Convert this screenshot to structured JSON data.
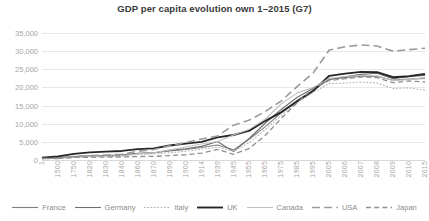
{
  "chart_data": {
    "type": "line",
    "title": "GDP per capita evolution own 1–2015 (G7)",
    "xlabel": "",
    "ylabel": "",
    "ylim": [
      0,
      35000
    ],
    "ytick_step": 5000,
    "ytick_labels": [
      "0",
      "5,000",
      "10,000",
      "15,000",
      "20,000",
      "25,000",
      "30,000",
      "35,000"
    ],
    "ytick_values": [
      0,
      5000,
      10000,
      15000,
      20000,
      25000,
      30000,
      35000
    ],
    "grid": "horizontal",
    "legend_position": "bottom",
    "xtick_rotation": 90,
    "categories": [
      "1",
      "1500",
      "1750",
      "1820",
      "1830",
      "1840",
      "1860",
      "1870",
      "1890",
      "1900",
      "1914",
      "1939",
      "1945",
      "1955",
      "1965",
      "1975",
      "1985",
      "1995",
      "2005",
      "2006",
      "2007",
      "2008",
      "2009",
      "2010",
      "2015"
    ],
    "series": [
      {
        "name": "France",
        "color": "#7f7f7f",
        "style": "solid",
        "width": 1.1,
        "values": [
          500,
          700,
          950,
          1150,
          1250,
          1400,
          1850,
          2000,
          2500,
          2900,
          3450,
          4150,
          2800,
          5800,
          9200,
          13100,
          16500,
          19200,
          22300,
          22700,
          23100,
          23000,
          22000,
          22300,
          22500
        ]
      },
      {
        "name": "Germany",
        "color": "#6e6e6e",
        "style": "solid",
        "width": 1.1,
        "values": [
          450,
          680,
          900,
          1080,
          1180,
          1300,
          1800,
          2000,
          2600,
          3100,
          3750,
          5100,
          2300,
          6000,
          10200,
          14000,
          17300,
          19800,
          22200,
          22900,
          23600,
          23900,
          22400,
          23000,
          23300
        ]
      },
      {
        "name": "Italy",
        "color": "#b5b5b5",
        "style": "dotted",
        "width": 1.1,
        "values": [
          700,
          900,
          1100,
          1120,
          1180,
          1250,
          1500,
          1700,
          2000,
          2400,
          2950,
          3550,
          2400,
          4800,
          8400,
          12300,
          15900,
          18600,
          21100,
          21200,
          21500,
          21200,
          19700,
          19900,
          19200
        ]
      },
      {
        "name": "UK",
        "color": "#262626",
        "style": "solid",
        "width": 1.9,
        "values": [
          600,
          1000,
          1700,
          2100,
          2300,
          2500,
          3000,
          3200,
          4000,
          4500,
          5000,
          6250,
          6900,
          8100,
          10800,
          13200,
          16200,
          19100,
          23200,
          23800,
          24300,
          24200,
          22800,
          23100,
          23700
        ]
      },
      {
        "name": "Canada",
        "color": "#c2c2c2",
        "style": "solid",
        "width": 1.1,
        "values": [
          400,
          400,
          700,
          900,
          950,
          1100,
          1700,
          2000,
          2800,
          3600,
          4400,
          5100,
          6900,
          8500,
          11300,
          15500,
          18500,
          20000,
          22500,
          23000,
          23300,
          23200,
          21900,
          22200,
          22700
        ]
      },
      {
        "name": "USA",
        "color": "#9a9a9a",
        "style": "longdash",
        "width": 1.6,
        "values": [
          400,
          400,
          900,
          1250,
          1350,
          1600,
          2400,
          2900,
          3900,
          4800,
          5800,
          6600,
          9600,
          11000,
          13400,
          16300,
          20300,
          24000,
          30300,
          31200,
          31700,
          31400,
          30000,
          30400,
          30800
        ]
      },
      {
        "name": "Japan",
        "color": "#8f8f8f",
        "style": "dash",
        "width": 1.3,
        "values": [
          400,
          500,
          700,
          750,
          800,
          850,
          950,
          1000,
          1200,
          1450,
          1900,
          2900,
          1550,
          3200,
          6800,
          11500,
          15800,
          19800,
          21900,
          22400,
          22900,
          22700,
          21300,
          21800,
          21500
        ]
      }
    ]
  },
  "legend": {
    "items": [
      {
        "label": "France"
      },
      {
        "label": "Germany"
      },
      {
        "label": "Italy"
      },
      {
        "label": "UK"
      },
      {
        "label": "Canada"
      },
      {
        "label": "USA"
      },
      {
        "label": "Japan"
      }
    ]
  }
}
